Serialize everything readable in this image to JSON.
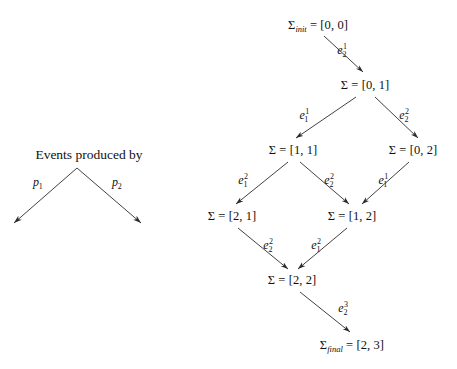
{
  "diagram": {
    "type": "state-lattice",
    "legend": {
      "title": "Events produced by",
      "left_label": "p",
      "left_sub": "1",
      "right_label": "p",
      "right_sub": "2",
      "apex": [
        77,
        168
      ],
      "left_end": [
        14,
        223
      ],
      "right_end": [
        141,
        223
      ],
      "left_label_pos": [
        38,
        182
      ],
      "right_label_pos": [
        117,
        182
      ]
    },
    "nodes": [
      {
        "id": "init",
        "prefix": "Σ",
        "sub": "init",
        "eq": " = ",
        "value": "[0, 0]",
        "x": 318,
        "y": 25
      },
      {
        "id": "s01",
        "prefix": "Σ",
        "sub": "",
        "eq": " = ",
        "value": "[0, 1]",
        "x": 365,
        "y": 85
      },
      {
        "id": "s11",
        "prefix": "Σ",
        "sub": "",
        "eq": " = ",
        "value": "[1, 1]",
        "x": 293,
        "y": 150
      },
      {
        "id": "s02",
        "prefix": "Σ",
        "sub": "",
        "eq": " = ",
        "value": "[0, 2]",
        "x": 413,
        "y": 150
      },
      {
        "id": "s21",
        "prefix": "Σ",
        "sub": "",
        "eq": " = ",
        "value": "[2, 1]",
        "x": 232,
        "y": 216
      },
      {
        "id": "s12",
        "prefix": "Σ",
        "sub": "",
        "eq": " = ",
        "value": "[1, 2]",
        "x": 352,
        "y": 216
      },
      {
        "id": "s22",
        "prefix": "Σ",
        "sub": "",
        "eq": " = ",
        "value": "[2, 2]",
        "x": 292,
        "y": 280
      },
      {
        "id": "final",
        "prefix": "Σ",
        "sub": "final",
        "eq": " = ",
        "value": "[2, 3]",
        "x": 352,
        "y": 345
      }
    ],
    "edges": [
      {
        "from": "init",
        "to": "s01",
        "label_base": "e",
        "label_sub": "2",
        "label_sup": "1",
        "x1": 324,
        "y1": 36,
        "x2": 363,
        "y2": 72,
        "lx": 344,
        "ly": 50
      },
      {
        "from": "s01",
        "to": "s11",
        "label_base": "e",
        "label_sub": "1",
        "label_sup": "1",
        "x1": 356,
        "y1": 97,
        "x2": 296,
        "y2": 138,
        "lx": 306,
        "ly": 115
      },
      {
        "from": "s01",
        "to": "s02",
        "label_base": "e",
        "label_sub": "2",
        "label_sup": "2",
        "x1": 375,
        "y1": 97,
        "x2": 418,
        "y2": 138,
        "lx": 406,
        "ly": 115
      },
      {
        "from": "s11",
        "to": "s21",
        "label_base": "e",
        "label_sub": "1",
        "label_sup": "2",
        "x1": 288,
        "y1": 162,
        "x2": 236,
        "y2": 204,
        "lx": 245,
        "ly": 180
      },
      {
        "from": "s11",
        "to": "s12",
        "label_base": "e",
        "label_sub": "2",
        "label_sup": "2",
        "x1": 300,
        "y1": 162,
        "x2": 349,
        "y2": 204,
        "lx": 331,
        "ly": 180
      },
      {
        "from": "s02",
        "to": "s12",
        "label_base": "e",
        "label_sub": "1",
        "label_sup": "1",
        "x1": 409,
        "y1": 162,
        "x2": 362,
        "y2": 204,
        "lx": 385,
        "ly": 180
      },
      {
        "from": "s21",
        "to": "s22",
        "label_base": "e",
        "label_sub": "2",
        "label_sup": "2",
        "x1": 238,
        "y1": 228,
        "x2": 288,
        "y2": 269,
        "lx": 270,
        "ly": 245
      },
      {
        "from": "s12",
        "to": "s22",
        "label_base": "e",
        "label_sub": "1",
        "label_sup": "2",
        "x1": 347,
        "y1": 228,
        "x2": 298,
        "y2": 269,
        "lx": 318,
        "ly": 245
      },
      {
        "from": "s22",
        "to": "final",
        "label_base": "e",
        "label_sub": "2",
        "label_sup": "3",
        "x1": 300,
        "y1": 292,
        "x2": 350,
        "y2": 332,
        "lx": 345,
        "ly": 308
      }
    ],
    "colors": {
      "background": "#ffffff",
      "stroke": "#2b2b2b",
      "text": "#111111"
    }
  }
}
